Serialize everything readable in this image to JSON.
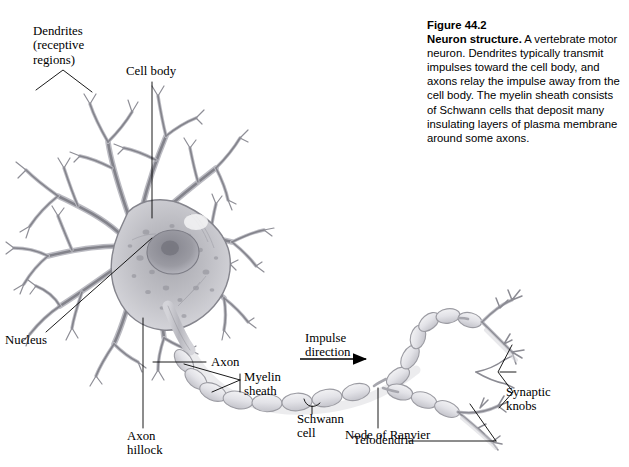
{
  "figure": {
    "number": "Figure 44.2",
    "title": "Neuron structure.",
    "body": " A vertebrate motor neuron. Dendrites typically transmit impulses toward the cell body, and axons relay the impulse away from the cell body. The myelin sheath consists of Schwann cells that deposit many insulating layers of plasma membrane around some axons."
  },
  "labels": {
    "dendrites": "Dendrites\n(receptive\nregions)",
    "cell_body": "Cell body",
    "nucleus": "Nucleus",
    "axon": "Axon",
    "axon_hillock": "Axon\nhillock",
    "myelin_sheath": "Myelin\nsheath",
    "schwann_cell": "Schwann\ncell",
    "impulse_direction": "Impulse\ndirection",
    "node_of_ranvier": "Node of Ranvier",
    "telodendria": "Telodendria",
    "synaptic_knobs": "Synaptic\nknobs"
  },
  "colors": {
    "background": "#ffffff",
    "ink": "#000000",
    "cell_outline": "#8a8a8f",
    "cell_fill_light": "#d8d8dc",
    "cell_fill_mid": "#b4b4ba",
    "cell_fill_dark": "#9a9aa1",
    "nucleus_fill": "#8e8e96",
    "myelin_fill": "#e4e4e8",
    "myelin_outline": "#9b9ba2",
    "shadow": "#c9c9cf"
  }
}
